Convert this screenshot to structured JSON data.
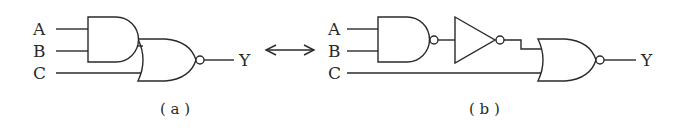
{
  "diagram_a": {
    "caption": "( a )",
    "inputs": [
      "A",
      "B",
      "C"
    ],
    "output": "Y",
    "gates": [
      "AND",
      "NOR"
    ]
  },
  "equivalence_arrow": "double-headed-arrow",
  "diagram_b": {
    "caption": "( b )",
    "inputs": [
      "A",
      "B",
      "C"
    ],
    "output": "Y",
    "gates": [
      "NAND",
      "NOT",
      "NOR"
    ]
  },
  "colors": {
    "line": "#2a2a2a",
    "background": "#ffffff"
  }
}
